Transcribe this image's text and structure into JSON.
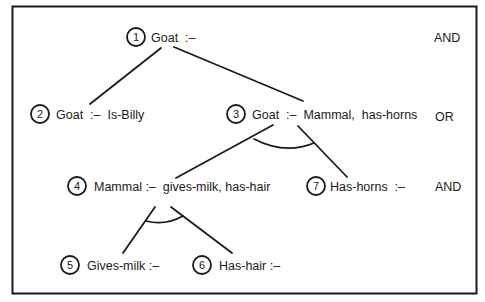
{
  "diagram": {
    "type": "and-or-tree",
    "nodes": [
      {
        "id": 1,
        "number": "1",
        "label": "Goat  :–",
        "cx": 136,
        "cy": 37,
        "tx": 151
      },
      {
        "id": 2,
        "number": "2",
        "label": "Goat  :–  Is-Billy",
        "cx": 40,
        "cy": 114,
        "tx": 56
      },
      {
        "id": 3,
        "number": "3",
        "label": "Goat  :–  Mammal,  has-horns",
        "cx": 236,
        "cy": 114,
        "tx": 252
      },
      {
        "id": 4,
        "number": "4",
        "label": "Mammal :–  gives-milk, has-hair",
        "cx": 77,
        "cy": 186,
        "tx": 94
      },
      {
        "id": 5,
        "number": "5",
        "label": "Gives-milk :–",
        "cx": 70,
        "cy": 265,
        "tx": 87
      },
      {
        "id": 6,
        "number": "6",
        "label": "Has-hair :–",
        "cx": 202,
        "cy": 265,
        "tx": 219
      },
      {
        "id": 7,
        "number": "7",
        "label": "Has-horns  :–",
        "cx": 316,
        "cy": 186,
        "tx": 330
      }
    ],
    "edges": [
      {
        "from": 1,
        "to": 2
      },
      {
        "from": 1,
        "to": 3
      },
      {
        "from": 3,
        "to": 4
      },
      {
        "from": 3,
        "to": 7
      },
      {
        "from": 4,
        "to": 5
      },
      {
        "from": 4,
        "to": 6
      }
    ],
    "level_labels": [
      {
        "text": "AND",
        "x": 440,
        "y": 37
      },
      {
        "text": "OR",
        "x": 441,
        "y": 116
      },
      {
        "text": "AND",
        "x": 441,
        "y": 187
      }
    ],
    "colors": {
      "ink": "#1a1a1a",
      "background": "#ffffff"
    }
  }
}
